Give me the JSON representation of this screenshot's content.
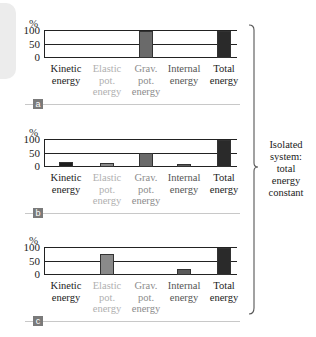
{
  "chart_data": [
    {
      "type": "bar",
      "panel_label": "a",
      "title": "",
      "xlabel": "",
      "ylabel": "%",
      "ylim": [
        0,
        100
      ],
      "yticks": [
        "100",
        "50",
        "0"
      ],
      "grid": true,
      "categories": [
        "Kinetic energy",
        "Elastic pot. energy",
        "Grav. pot. energy",
        "Internal energy",
        "Total energy"
      ],
      "values": [
        0,
        0,
        100,
        0,
        100
      ]
    },
    {
      "type": "bar",
      "panel_label": "b",
      "title": "",
      "xlabel": "",
      "ylabel": "%",
      "ylim": [
        0,
        100
      ],
      "yticks": [
        "100",
        "50",
        "0"
      ],
      "grid": true,
      "categories": [
        "Kinetic energy",
        "Elastic pot. energy",
        "Grav. pot. energy",
        "Internal energy",
        "Total energy"
      ],
      "values": [
        20,
        15,
        50,
        12,
        100
      ]
    },
    {
      "type": "bar",
      "panel_label": "c",
      "title": "",
      "xlabel": "",
      "ylabel": "%",
      "ylim": [
        0,
        100
      ],
      "yticks": [
        "100",
        "50",
        "0"
      ],
      "grid": true,
      "categories": [
        "Kinetic energy",
        "Elastic pot. energy",
        "Grav. pot. energy",
        "Internal energy",
        "Total energy"
      ],
      "values": [
        0,
        77,
        0,
        23,
        100
      ]
    }
  ],
  "labels": {
    "percent": "%",
    "tick_100": "100",
    "tick_50": "50",
    "tick_0": "0",
    "categories": [
      [
        "Kinetic",
        "energy"
      ],
      [
        "Elastic",
        "pot.",
        "energy"
      ],
      [
        "Grav.",
        "pot.",
        "energy"
      ],
      [
        "Internal",
        "energy"
      ],
      [
        "Total",
        "energy"
      ]
    ],
    "panel_a": "a",
    "panel_b": "b",
    "panel_c": "c"
  },
  "side_note": [
    "Isolated",
    "system:",
    "total",
    "energy",
    "constant"
  ],
  "colors": {
    "kinetic": "#1e1e1e",
    "elastic": "#8a8a8a",
    "grav": "#6a6a6a",
    "internal": "#5a5a5a",
    "total": "#2a2a2a",
    "label_kinetic": "#222222",
    "label_elastic": "#b0b0b0",
    "label_grav": "#8c8c8c",
    "label_internal": "#555555",
    "label_total": "#222222"
  }
}
